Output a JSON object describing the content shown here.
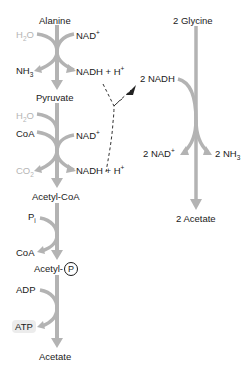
{
  "diagram": {
    "type": "metabolic-pathway",
    "colors": {
      "arrow": "#b3b3b3",
      "text": "#1a1a1a",
      "faded_text": "#b5b5b5",
      "dashed": "#333333"
    },
    "left_pathway": {
      "metabolites": {
        "alanine": "Alanine",
        "pyruvate": "Pyruvate",
        "acetyl_coa": "Acetyl-CoA",
        "acetyl_p_prefix": "Acetyl-",
        "acetyl_p_symbol": "P",
        "acetate": "Acetate"
      },
      "step1": {
        "in_left": {
          "base": "H",
          "sub": "2",
          "rest": "O"
        },
        "out_left": {
          "base": "NH",
          "sub": "3"
        },
        "in_right": {
          "base": "NAD",
          "sup": "+"
        },
        "out_right": {
          "base": "NADH + H",
          "sup": "+"
        }
      },
      "step2": {
        "in_left_1": {
          "base": "H",
          "sub": "2",
          "rest": "O"
        },
        "in_left_2": "CoA",
        "out_left": {
          "base": "CO",
          "sub": "2"
        },
        "in_right": {
          "base": "NAD",
          "sup": "+"
        },
        "out_right": {
          "base": "NADH + H",
          "sup": "+"
        }
      },
      "step3": {
        "in_left": {
          "base": "P",
          "sub": "i"
        },
        "out_left": "CoA"
      },
      "step4": {
        "in_left": "ADP",
        "out_left": "ATP"
      }
    },
    "right_pathway": {
      "substrate": "2 Glycine",
      "in_left": "2 NADH",
      "out_left": {
        "base": "2 NAD",
        "sup": "+"
      },
      "out_right": {
        "base": "2 NH",
        "sub": "3"
      },
      "product": "2 Acetate"
    }
  }
}
